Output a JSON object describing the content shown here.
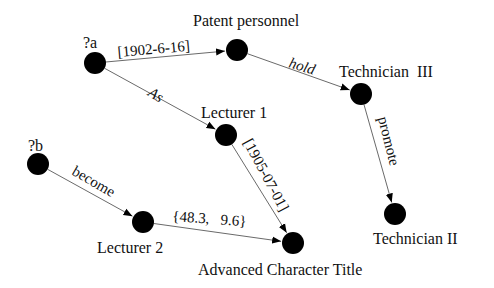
{
  "diagram": {
    "type": "knowledge-graph",
    "nodes": [
      {
        "id": "a",
        "label": "?a"
      },
      {
        "id": "patent",
        "label": "Patent personnel"
      },
      {
        "id": "tech3",
        "label": "Technician  III"
      },
      {
        "id": "lect1",
        "label": "Lecturer 1"
      },
      {
        "id": "tech2",
        "label": "Technician II"
      },
      {
        "id": "b",
        "label": "?b"
      },
      {
        "id": "lect2",
        "label": "Lecturer 2"
      },
      {
        "id": "act",
        "label": "Advanced Character Title"
      }
    ],
    "edges": [
      {
        "id": "e1",
        "from": "a",
        "to": "patent",
        "label": "[1902-6-16]",
        "italic": false
      },
      {
        "id": "e2",
        "from": "patent",
        "to": "tech3",
        "label": "hold",
        "italic": true
      },
      {
        "id": "e3",
        "from": "a",
        "to": "lect1",
        "label": "As",
        "italic": true
      },
      {
        "id": "e4",
        "from": "tech3",
        "to": "tech2",
        "label": "promote",
        "italic": false
      },
      {
        "id": "e5",
        "from": "lect1",
        "to": "act",
        "label": "[1905-07-01]",
        "italic": false
      },
      {
        "id": "e6",
        "from": "b",
        "to": "lect2",
        "label": "become",
        "italic": false
      },
      {
        "id": "e7",
        "from": "lect2",
        "to": "act",
        "label": "{48.3,   9.6}",
        "italic": false
      }
    ]
  },
  "colors": {
    "node": "#000000",
    "edge": "#6a6a6a",
    "text": "#111111",
    "background": "#ffffff"
  }
}
